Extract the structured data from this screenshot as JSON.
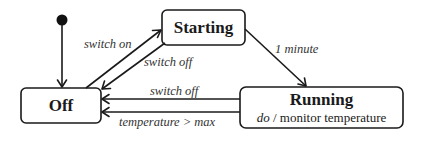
{
  "diagram": {
    "type": "uml-state-machine",
    "colors": {
      "stroke": "#1a1a1a",
      "text": "#1a1a1a",
      "label": "#333333",
      "background": "#ffffff"
    },
    "initial_state": {
      "target": "Off"
    },
    "states": [
      {
        "id": "off",
        "name": "Off"
      },
      {
        "id": "starting",
        "name": "Starting"
      },
      {
        "id": "running",
        "name": "Running",
        "activity_keyword": "do",
        "activity_separator": " / ",
        "activity": "monitor temperature"
      }
    ],
    "transitions": [
      {
        "from": "Off",
        "to": "Starting",
        "label": "switch on"
      },
      {
        "from": "Starting",
        "to": "Off",
        "label": "switch off"
      },
      {
        "from": "Starting",
        "to": "Running",
        "label": "1 minute"
      },
      {
        "from": "Running",
        "to": "Off",
        "label": "switch off"
      },
      {
        "from": "Running",
        "to": "Off",
        "label": "temperature > max"
      }
    ]
  }
}
